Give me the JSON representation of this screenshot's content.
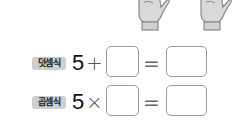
{
  "illustration": {
    "hands": [
      {
        "icon": "open-hand-icon",
        "description": "left hand with five fingers"
      },
      {
        "icon": "open-hand-icon",
        "description": "right hand with five fingers"
      }
    ]
  },
  "equations": [
    {
      "label": "덧셈식",
      "first_number": "5",
      "operator": "+",
      "operand_blank": "",
      "equals": "=",
      "result_blank": ""
    },
    {
      "label": "곱셈식",
      "first_number": "5",
      "operator": "×",
      "operand_blank": "",
      "equals": "=",
      "result_blank": ""
    }
  ],
  "colors": {
    "badge_bg": "#cfcfcf",
    "box_border": "#999999",
    "hand_fill": "#d9d9d9",
    "hand_stroke": "#8a8a8a"
  }
}
